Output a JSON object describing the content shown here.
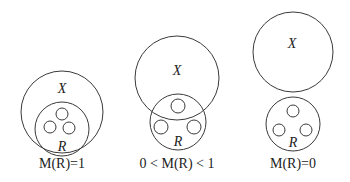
{
  "diagrams": [
    {
      "id": "full",
      "x_label": "X",
      "r_label": "R",
      "caption": "M(R)=1",
      "x_circle": {
        "cx": 62,
        "cy": 112,
        "r": 41
      },
      "r_circle": {
        "cx": 62,
        "cy": 129,
        "r": 27
      },
      "small_circles": [
        {
          "cx": 62,
          "cy": 115,
          "r": 6
        },
        {
          "cx": 50,
          "cy": 127,
          "r": 6
        },
        {
          "cx": 69,
          "cy": 128,
          "r": 6
        }
      ],
      "x_label_pos": [
        62,
        92
      ],
      "r_label_pos": [
        62,
        150
      ],
      "caption_pos": [
        62,
        167
      ]
    },
    {
      "id": "partial",
      "x_label": "X",
      "r_label": "R",
      "caption": "0 < M(R) < 1",
      "x_circle": {
        "cx": 177,
        "cy": 78,
        "r": 42
      },
      "r_circle": {
        "cx": 178,
        "cy": 122,
        "r": 28
      },
      "small_circles": [
        {
          "cx": 178,
          "cy": 106,
          "r": 7
        },
        {
          "cx": 161,
          "cy": 127,
          "r": 7
        },
        {
          "cx": 194,
          "cy": 127,
          "r": 7
        }
      ],
      "x_label_pos": [
        177,
        75
      ],
      "r_label_pos": [
        178,
        145
      ],
      "caption_pos": [
        177,
        167
      ]
    },
    {
      "id": "none",
      "x_label": "X",
      "r_label": "R",
      "caption": "M(R)=0",
      "x_circle": {
        "cx": 293,
        "cy": 52,
        "r": 40
      },
      "r_circle": {
        "cx": 293,
        "cy": 124,
        "r": 27
      },
      "small_circles": [
        {
          "cx": 293,
          "cy": 111,
          "r": 6
        },
        {
          "cx": 278,
          "cy": 130,
          "r": 6
        },
        {
          "cx": 306,
          "cy": 130,
          "r": 6
        }
      ],
      "x_label_pos": [
        292,
        48
      ],
      "r_label_pos": [
        293,
        146
      ],
      "caption_pos": [
        293,
        167
      ]
    }
  ]
}
